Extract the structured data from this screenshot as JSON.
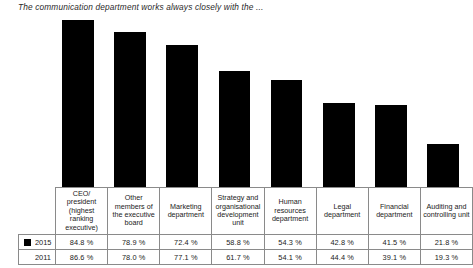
{
  "chart_data": {
    "type": "bar",
    "title": "The communication department works always closely with the ...",
    "xlabel": "",
    "ylabel": "",
    "ylim": [
      0,
      100
    ],
    "grid": false,
    "legend_position": "table-row-labels",
    "categories": [
      "CEO/ president (highest ranking executive)",
      "Other members of the executive board",
      "Marketing department",
      "Strategy and organisational development unit",
      "Human resources department",
      "Legal department",
      "Financial department",
      "Auditing and controlling unit"
    ],
    "plotted_series": "2015",
    "series": [
      {
        "name": "2015",
        "has_marker": true,
        "values": [
          84.8,
          78.9,
          72.4,
          58.8,
          54.3,
          42.8,
          41.5,
          21.8
        ],
        "labels": [
          "84.8 %",
          "78.9 %",
          "72.4 %",
          "58.8 %",
          "54.3 %",
          "42.8 %",
          "41.5 %",
          "21.8 %"
        ]
      },
      {
        "name": "2011",
        "has_marker": false,
        "values": [
          86.6,
          78.0,
          77.1,
          61.7,
          54.1,
          44.4,
          39.1,
          19.3
        ],
        "labels": [
          "86.6 %",
          "78.0 %",
          "77.1 %",
          "61.7 %",
          "54.1 %",
          "44.4 %",
          "39.1 %",
          "19.3 %"
        ]
      }
    ],
    "bar_color": "#000000"
  }
}
